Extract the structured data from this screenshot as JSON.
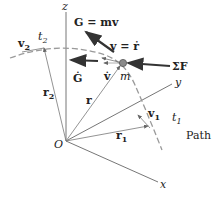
{
  "figure": {
    "labels": {
      "z_axis": "z",
      "y_axis": "y",
      "x_axis": "x",
      "origin": "O",
      "momentum": "G = mv",
      "G_dot": "Ġ",
      "velocity": "v = ṙ",
      "v_dot": "v̇",
      "mass": "m",
      "net_force": "ΣF",
      "v2": "v",
      "v2_sub": "2",
      "t2": "t",
      "t2_sub": "2",
      "r2": "r",
      "r2_sub": "2",
      "r": "r",
      "v1": "v",
      "v1_sub": "1",
      "t1": "t",
      "t1_sub": "1",
      "r1": "r",
      "r1_sub": "1",
      "path": "Path"
    },
    "colors": {
      "line": "#555555",
      "arrow": "#333333",
      "path_dash": "#9a9a9a",
      "particle": "#8a8a8a"
    }
  }
}
